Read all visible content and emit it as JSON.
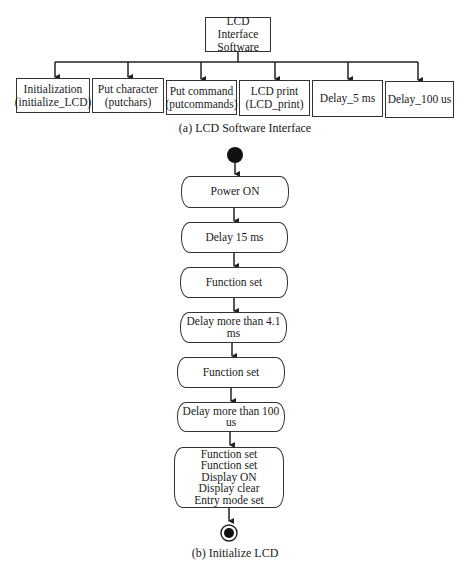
{
  "part_a": {
    "root": "LCD Interface\nSoftware",
    "children": [
      "Initialization\n(initialize_LCD)",
      "Put character\n(putchars)",
      "Put command\n(putcommands)",
      "LCD print\n(LCD_print)",
      "Delay_5 ms",
      "Delay_100 us"
    ],
    "caption": "(a) LCD Software Interface"
  },
  "part_b": {
    "start_node": "initial-state",
    "steps": [
      "Power ON",
      "Delay 15 ms",
      "Function set",
      "Delay more than 4.1 ms",
      "Function set",
      "Delay more than 100 us",
      "Function set\nFunction set\nDisplay ON\nDisplay clear\nEntry mode set"
    ],
    "end_node": "final-state",
    "caption": "(b) Initialize LCD"
  }
}
